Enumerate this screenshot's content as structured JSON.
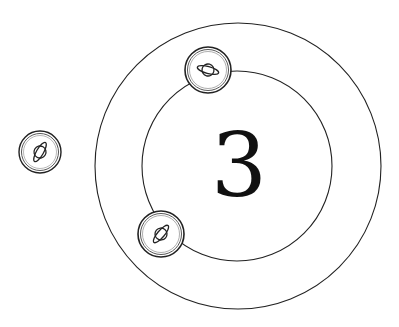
{
  "board": {
    "center_number": "3",
    "outer_ring": {
      "cx": 238,
      "cy": 166,
      "r": 143
    },
    "inner_ring": {
      "cx": 237,
      "cy": 166,
      "r": 95
    },
    "stroke_color": "#222222"
  },
  "tokens": [
    {
      "id": "token-top",
      "cx": 208,
      "cy": 70,
      "r": 23,
      "icon": "planet-icon",
      "rotation": 15
    },
    {
      "id": "token-bottom-left",
      "cx": 161,
      "cy": 234,
      "r": 23,
      "icon": "planet-icon",
      "rotation": -50
    },
    {
      "id": "token-left",
      "cx": 40,
      "cy": 152,
      "r": 21,
      "icon": "planet-icon",
      "rotation": -60
    }
  ]
}
